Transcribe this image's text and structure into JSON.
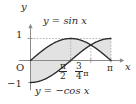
{
  "figure": {
    "kind": "cartesian-plot",
    "background_color": "#ffffff",
    "curve_color": "#2b2b2b",
    "axis_color": "#8a8a8a",
    "fill_color": "#e2e2e2",
    "dashed_color": "#9a9a9a",
    "text_color": "#2b2b2b"
  },
  "axes": {
    "y_axis_label": "y",
    "x_axis_label": "x",
    "origin_label": "O",
    "y_ticks": [
      {
        "value": 1,
        "label": "1"
      },
      {
        "value": -1,
        "label": "−1"
      }
    ],
    "x_ticks": [
      {
        "value": 1.5707963,
        "label_num": "π",
        "label_den": "2",
        "kind": "fraction"
      },
      {
        "value": 2.3561945,
        "label_num": "3",
        "label_den": "4",
        "label_suffix": "π",
        "kind": "fraction-with-suffix"
      },
      {
        "value": 3.1415927,
        "label": "π",
        "kind": "plain"
      }
    ],
    "xlim": [
      -0.45,
      3.62
    ],
    "ylim": [
      -1.35,
      1.55
    ],
    "grid": "dashed-guides-only"
  },
  "curve_labels": {
    "sine": "y = sin x",
    "negcos": "y = −cos x"
  },
  "chart_data": {
    "type": "line",
    "title": "",
    "xlabel": "x",
    "ylabel": "y",
    "xlim": [
      -0.45,
      3.62
    ],
    "ylim": [
      -1.35,
      1.55
    ],
    "grid": false,
    "legend": "inline-annotations",
    "x": [
      0.0,
      0.19634954,
      0.39269908,
      0.58904862,
      0.78539816,
      0.9817477,
      1.17809725,
      1.37444679,
      1.57079633,
      1.76714587,
      1.96349541,
      2.15984495,
      2.35619449,
      2.55254403,
      2.74889357,
      2.94524311,
      3.14159265
    ],
    "series": [
      {
        "name": "y = sin x",
        "label": "y = sin x",
        "values": [
          0.0,
          0.19509,
          0.38268,
          0.55557,
          0.70711,
          0.83147,
          0.92388,
          0.98079,
          1.0,
          0.98079,
          0.92388,
          0.83147,
          0.70711,
          0.55557,
          0.38268,
          0.19509,
          0.0
        ]
      },
      {
        "name": "y = -cos x",
        "label": "y = −cos x",
        "values": [
          -1.0,
          -0.98079,
          -0.92388,
          -0.83147,
          -0.70711,
          -0.55557,
          -0.38268,
          -0.19509,
          0.0,
          0.19509,
          0.38268,
          0.55557,
          0.70711,
          0.83147,
          0.92388,
          0.98079,
          1.0
        ]
      }
    ],
    "annotations": [
      {
        "text": "y = sin x",
        "x": 1.05,
        "y": 1.3
      },
      {
        "text": "y = −cos x",
        "x": 1.2,
        "y": -1.18
      }
    ],
    "shaded_regions": [
      {
        "name": "region-0-to-3pi4",
        "between": [
          "y = sin x",
          "y = -cos x"
        ],
        "x_from": 0.0,
        "x_to": 2.3561945
      },
      {
        "name": "region-3pi4-to-pi",
        "between": [
          "y = -cos x",
          "y = sin x"
        ],
        "x_from": 2.3561945,
        "x_to": 3.1415927
      }
    ],
    "intersection_points": [
      {
        "x": 2.3561945,
        "y": 0.70711,
        "label": "3π/4"
      }
    ],
    "guide_lines": [
      {
        "orientation": "horizontal",
        "value": 1,
        "style": "dashed"
      },
      {
        "orientation": "vertical",
        "value": 1.5707963,
        "style": "dashed"
      },
      {
        "orientation": "vertical",
        "value": 2.3561945,
        "style": "dashed"
      },
      {
        "orientation": "vertical",
        "value": 3.1415927,
        "style": "dashed"
      }
    ]
  }
}
